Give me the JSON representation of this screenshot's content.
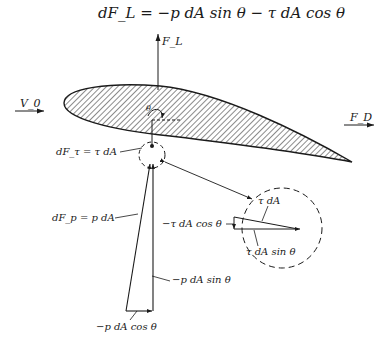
{
  "equation": "dF_L = −p dA sin θ − τ dA cos θ",
  "labels": {
    "lift": "F_L",
    "drag": "F_D",
    "freestream": "V_0",
    "theta": "θ",
    "shear_force": "dF_τ = τ dA",
    "pressure_force": "dF_p = p dA",
    "pressure_sin": "−p dA sin θ",
    "pressure_cos": "−p dA cos θ",
    "inset_shear": "τ dA",
    "inset_shear_cos": "−τ dA cos θ",
    "inset_shear_sin": "τ dA sin θ"
  },
  "colors": {
    "ink": "#1a1a1a",
    "background": "#ffffff"
  }
}
